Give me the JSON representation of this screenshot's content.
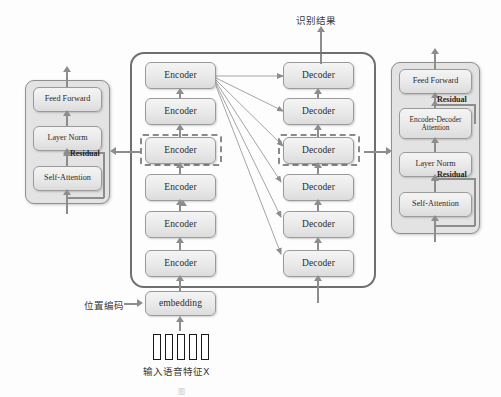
{
  "diagram": {
    "title_top": "识别结果",
    "input_label": "输入语音特征X",
    "positional_label": "位置编码",
    "embedding_label": "embedding",
    "caption": "图"
  },
  "encoder_stack": {
    "name": "encoder-stack",
    "items": [
      {
        "label": "Encoder",
        "highlighted": false
      },
      {
        "label": "Encoder",
        "highlighted": false
      },
      {
        "label": "Encoder",
        "highlighted": true
      },
      {
        "label": "Encoder",
        "highlighted": false
      },
      {
        "label": "Encoder",
        "highlighted": false
      },
      {
        "label": "Encoder",
        "highlighted": false
      }
    ]
  },
  "decoder_stack": {
    "name": "decoder-stack",
    "items": [
      {
        "label": "Decoder",
        "highlighted": false
      },
      {
        "label": "Decoder",
        "highlighted": false
      },
      {
        "label": "Decoder",
        "highlighted": true
      },
      {
        "label": "Decoder",
        "highlighted": false
      },
      {
        "label": "Decoder",
        "highlighted": false
      },
      {
        "label": "Decoder",
        "highlighted": false
      }
    ]
  },
  "encoder_detail": {
    "name": "encoder-detail-panel",
    "blocks": [
      {
        "label": "Feed Forward"
      },
      {
        "label": "Layer Norm"
      },
      {
        "label": "Self-Attention"
      }
    ],
    "residual_labels": [
      "Residual"
    ]
  },
  "decoder_detail": {
    "name": "decoder-detail-panel",
    "blocks": [
      {
        "label": "Feed Forward"
      },
      {
        "label": "Encoder-Decoder Attention"
      },
      {
        "label": "Layer Norm"
      },
      {
        "label": "Self-Attention"
      }
    ],
    "residual_labels": [
      "Residual",
      "Residual"
    ]
  },
  "colors": {
    "box_border": "#9a9a9a",
    "panel_bg": "#e3e3e3",
    "arrow": "#8d8d8d",
    "container_border": "#6f6f6f",
    "highlight_dash": "#8a8a8a"
  }
}
